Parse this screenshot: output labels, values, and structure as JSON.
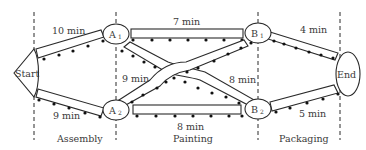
{
  "diagram": {
    "type": "assembly-line-network",
    "stages": [
      {
        "id": "assembly",
        "label": "Assembly"
      },
      {
        "id": "painting",
        "label": "Painting"
      },
      {
        "id": "packaging",
        "label": "Packaging"
      }
    ],
    "nodes": {
      "start": {
        "label": "Start"
      },
      "a1": {
        "label": "A",
        "sub": "1"
      },
      "a2": {
        "label": "A",
        "sub": "2"
      },
      "b1": {
        "label": "B",
        "sub": "1"
      },
      "b2": {
        "label": "B",
        "sub": "2"
      },
      "end": {
        "label": "End"
      }
    },
    "edges": [
      {
        "id": "start-a1",
        "from": "Start",
        "to": "A1",
        "label": "10 min"
      },
      {
        "id": "start-a2",
        "from": "Start",
        "to": "A2",
        "label": "9 min"
      },
      {
        "id": "a1-b1",
        "from": "A1",
        "to": "B1",
        "label": "7 min"
      },
      {
        "id": "a1-b2",
        "from": "A1",
        "to": "B2",
        "label": "8 min"
      },
      {
        "id": "a2-b1",
        "from": "A2",
        "to": "B1",
        "label": "9 min"
      },
      {
        "id": "a2-b2",
        "from": "A2",
        "to": "B2",
        "label": "8 min"
      },
      {
        "id": "b1-end",
        "from": "B1",
        "to": "End",
        "label": "4 min"
      },
      {
        "id": "b2-end",
        "from": "B2",
        "to": "End",
        "label": "5 min"
      }
    ]
  }
}
